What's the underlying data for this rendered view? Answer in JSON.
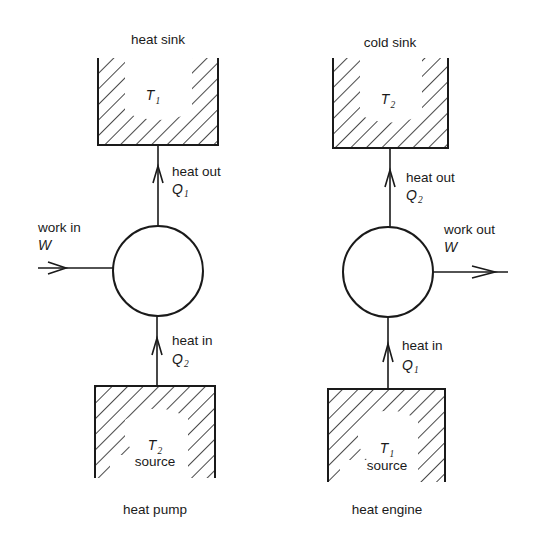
{
  "diagrams": {
    "left": {
      "caption": "heat pump",
      "top_reservoir": {
        "title": "heat sink",
        "symbol": "T",
        "subscript": "1"
      },
      "top_flow": {
        "label": "heat out",
        "symbol": "Q",
        "subscript": "1"
      },
      "work": {
        "label": "work in",
        "symbol": "W",
        "direction": "in"
      },
      "bottom_flow": {
        "label": "heat in",
        "symbol": "Q",
        "subscript": "2"
      },
      "bottom_reservoir": {
        "symbol": "T",
        "subscript": "2",
        "label": "source"
      }
    },
    "right": {
      "caption": "heat engine",
      "top_reservoir": {
        "title": "cold sink",
        "symbol": "T",
        "subscript": "2"
      },
      "top_flow": {
        "label": "heat out",
        "symbol": "Q",
        "subscript": "2"
      },
      "work": {
        "label": "work out",
        "symbol": "W",
        "direction": "out"
      },
      "bottom_flow": {
        "label": "heat in",
        "symbol": "Q",
        "subscript": "1"
      },
      "bottom_reservoir": {
        "symbol": "T",
        "subscript": "1",
        "label": "source"
      }
    }
  },
  "colors": {
    "ink": "#1a1a1a",
    "background": "#ffffff"
  }
}
